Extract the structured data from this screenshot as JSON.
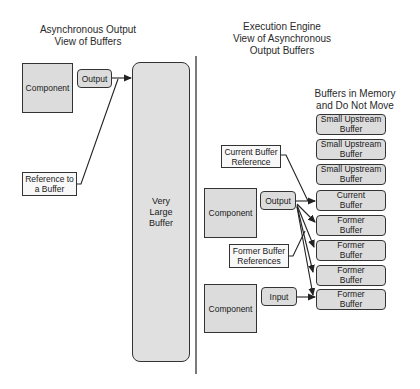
{
  "left_view": {
    "title": "Asynchronous Output\nView of Buffers",
    "component_label": "Component",
    "output_label": "Output",
    "reference_label": "Reference to\na Buffer",
    "very_large_buffer_label": "Very\nLarge\nBuffer"
  },
  "right_view": {
    "title": "Execution Engine\nView of Asynchronous\nOutput Buffers",
    "buffers_heading": "Buffers in Memory\nand Do Not Move",
    "current_buffer_reference_label": "Current Buffer\nReference",
    "former_buffer_references_label": "Former Buffer\nReferences",
    "output_component": {
      "component_label": "Component",
      "port_label": "Output"
    },
    "input_component": {
      "component_label": "Component",
      "port_label": "Input"
    },
    "buffers": [
      {
        "label": "Small Upstream\nBuffer"
      },
      {
        "label": "Small Upstream\nBuffer"
      },
      {
        "label": "Small Upstream\nBuffer"
      },
      {
        "label": "Current\nBuffer"
      },
      {
        "label": "Former\nBuffer"
      },
      {
        "label": "Former\nBuffer"
      },
      {
        "label": "Former\nBuffer"
      },
      {
        "label": "Former\nBuffer"
      }
    ]
  },
  "colors": {
    "box_fill": "#dcdcdc",
    "stroke": "#333333",
    "reference_fill": "#f8f8f8",
    "background": "#ffffff"
  }
}
